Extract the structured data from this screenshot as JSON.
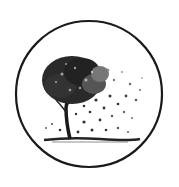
{
  "logo": {
    "description": "Tree inside circle emblem",
    "colors": {
      "background": "#ffffff",
      "ink": "#1a1a1a",
      "mid": "#555555",
      "light": "#999999"
    }
  }
}
